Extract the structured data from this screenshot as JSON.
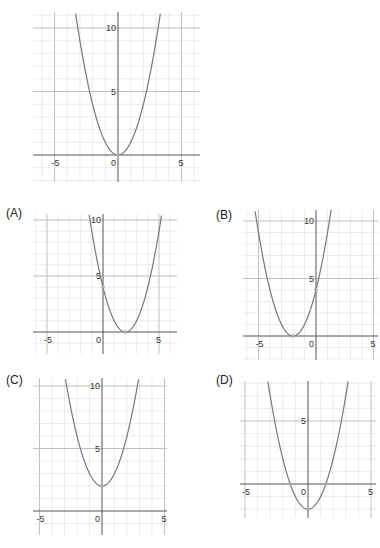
{
  "colors": {
    "grid_minor": "#e4e4e4",
    "grid_major": "#b9b9b9",
    "axis": "#555555",
    "curve": "#777777",
    "point": "#aaaaaa",
    "label": "#333333"
  },
  "chart_data": [
    {
      "id": "original",
      "type": "line",
      "label": "",
      "title": "",
      "function": "y = x^2",
      "vertex": [
        0,
        0
      ],
      "points_marked": [
        [
          0,
          0
        ]
      ],
      "xlim": [
        -6.7,
        6.5
      ],
      "ylim": [
        -2,
        11.2
      ],
      "x_ticks": [
        -5,
        0,
        5
      ],
      "y_ticks": [
        5,
        10
      ],
      "tick_labels": {
        "x": [
          "-5",
          "0",
          "5"
        ],
        "y": [
          "5",
          "10"
        ]
      },
      "grid": true,
      "pixel": {
        "origin": [
          118,
          155
        ],
        "unit": 12.7,
        "box": [
          33,
          12,
          200,
          182
        ]
      }
    },
    {
      "id": "A",
      "type": "line",
      "label": "(A)",
      "function": "y = (x - 2)^2",
      "vertex": [
        2,
        0
      ],
      "points_marked": [
        [
          2,
          0
        ],
        [
          0,
          4
        ]
      ],
      "xlim": [
        -6.3,
        6.8
      ],
      "ylim": [
        -2,
        10.6
      ],
      "x_ticks": [
        -5,
        0,
        5
      ],
      "y_ticks": [
        5,
        10
      ],
      "tick_labels": {
        "x": [
          "-5",
          "0",
          "5"
        ],
        "y": [
          "5",
          "10"
        ]
      },
      "grid": true,
      "pixel": {
        "origin": [
          103,
          332
        ],
        "unit": 11.2,
        "box": [
          33,
          214,
          177,
          354
        ]
      }
    },
    {
      "id": "B",
      "type": "line",
      "label": "(B)",
      "function": "y = (x + 2)^2",
      "vertex": [
        -2,
        0
      ],
      "points_marked": [
        [
          -2,
          0
        ],
        [
          0,
          4
        ]
      ],
      "xlim": [
        -6.4,
        5.4
      ],
      "ylim": [
        -2.3,
        11.1
      ],
      "x_ticks": [
        -5,
        0,
        5
      ],
      "y_ticks": [
        5,
        10
      ],
      "tick_labels": {
        "x": [
          "-5",
          "0",
          "5"
        ],
        "y": [
          "5",
          "10"
        ]
      },
      "grid": true,
      "pixel": {
        "origin": [
          316,
          336
        ],
        "unit": 11.5,
        "box": [
          243,
          210,
          378,
          360
        ]
      }
    },
    {
      "id": "C",
      "type": "line",
      "label": "(C)",
      "function": "y = x^2 + 2",
      "vertex": [
        0,
        2
      ],
      "points_marked": [
        [
          0,
          2
        ]
      ],
      "xlim": [
        -5.5,
        5.2
      ],
      "ylim": [
        -1.9,
        10.6
      ],
      "x_ticks": [
        -5,
        0,
        5
      ],
      "y_ticks": [
        5,
        10
      ],
      "tick_labels": {
        "x": [
          "-5",
          "0",
          "5"
        ],
        "y": [
          "5",
          "10"
        ]
      },
      "grid": true,
      "pixel": {
        "origin": [
          102,
          511
        ],
        "unit": 12.5,
        "box": [
          33,
          378,
          167,
          535
        ]
      }
    },
    {
      "id": "D",
      "type": "line",
      "label": "(D)",
      "function": "y = x^2 - 2",
      "vertex": [
        0,
        -2
      ],
      "points_marked": [
        [
          0,
          -2
        ],
        [
          -1.41,
          0
        ],
        [
          1.41,
          0
        ]
      ],
      "xlim": [
        -5.4,
        5.4
      ],
      "ylim": [
        -2.7,
        8.2
      ],
      "x_ticks": [
        -5,
        0,
        5
      ],
      "y_ticks": [
        5
      ],
      "tick_labels": {
        "x": [
          "-5",
          "0",
          "5"
        ],
        "y": [
          "5"
        ]
      },
      "grid": true,
      "pixel": {
        "origin": [
          308,
          484
        ],
        "unit": 12.6,
        "box": [
          240,
          381,
          376,
          518
        ]
      }
    }
  ],
  "panels": {
    "original": {
      "label": ""
    },
    "A": {
      "label": "(A)"
    },
    "B": {
      "label": "(B)"
    },
    "C": {
      "label": "(C)"
    },
    "D": {
      "label": "(D)"
    }
  }
}
